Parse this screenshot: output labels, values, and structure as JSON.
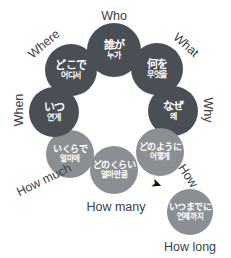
{
  "diagram": {
    "type": "circular-wheel",
    "title_visible": false,
    "colors": {
      "dark_node": "#4a4f56",
      "light_node": "#8b8f94",
      "node_text": "#ffffff",
      "label_text": "#3b3f44",
      "background": "#ffffff",
      "arrow": "#111111"
    },
    "nodes": [
      {
        "key": "who",
        "label": "Who",
        "japanese": "誰が",
        "korean": "누가",
        "shade": "dark",
        "cx": 114,
        "cy": 50,
        "r": 27,
        "label_x": 114,
        "label_y": 16,
        "label_rot": 0
      },
      {
        "key": "what",
        "label": "What",
        "japanese": "何を",
        "korean": "무엇을",
        "shade": "dark",
        "cx": 157,
        "cy": 69,
        "r": 26,
        "label_x": 186,
        "label_y": 45,
        "label_rot": 42
      },
      {
        "key": "why",
        "label": "Why",
        "japanese": "なぜ",
        "korean": "왜",
        "shade": "dark",
        "cx": 173,
        "cy": 111,
        "r": 25,
        "label_x": 208,
        "label_y": 110,
        "label_rot": 90
      },
      {
        "key": "how",
        "label": "How",
        "japanese": "どのように",
        "korean": "어떻게",
        "shade": "light",
        "cx": 160,
        "cy": 152,
        "r": 24,
        "label_x": 188,
        "label_y": 176,
        "label_rot": 56
      },
      {
        "key": "how_many",
        "label": "How many",
        "japanese": "どのくらい",
        "korean": "얼마만큼",
        "shade": "light",
        "cx": 114,
        "cy": 170,
        "r": 24,
        "label_x": 116,
        "label_y": 207,
        "label_rot": 0
      },
      {
        "key": "how_much",
        "label": "How much",
        "japanese": "いくらで",
        "korean": "얼마에",
        "shade": "light",
        "cx": 70,
        "cy": 154,
        "r": 24,
        "label_x": 44,
        "label_y": 180,
        "label_rot": -26
      },
      {
        "key": "when",
        "label": "When",
        "japanese": "いつ",
        "korean": "연게",
        "shade": "dark",
        "cx": 54,
        "cy": 112,
        "r": 25,
        "label_x": 19,
        "label_y": 110,
        "label_rot": -90
      },
      {
        "key": "where",
        "label": "Where",
        "japanese": "どこで",
        "korean": "어디서",
        "shade": "dark",
        "cx": 71,
        "cy": 70,
        "r": 26,
        "label_x": 44,
        "label_y": 44,
        "label_rot": -40
      },
      {
        "key": "how_long",
        "label": "How long",
        "japanese": "いつまでに",
        "korean": "언제까지",
        "shade": "light",
        "cx": 190,
        "cy": 212,
        "r": 23,
        "label_x": 190,
        "label_y": 247,
        "label_rot": 0
      }
    ],
    "arrow": {
      "glyph": "➤",
      "name": "arrow-marker",
      "x": 151,
      "y": 178,
      "rot": 20
    }
  }
}
